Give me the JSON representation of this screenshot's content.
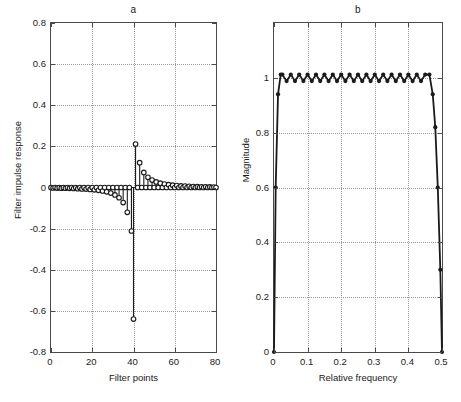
{
  "figure": {
    "width": 461,
    "height": 402,
    "background": "#ffffff",
    "line_color": "#1a1a1a",
    "grid_color": "#9a9a9a"
  },
  "panels": {
    "a": {
      "title": "a",
      "xlabel": "Filter points",
      "ylabel": "Filter impulse response",
      "xticks": [
        "0",
        "20",
        "40",
        "60",
        "80"
      ],
      "yticks": [
        "-0.8",
        "-0.6",
        "-0.4",
        "-0.2",
        "0",
        "0.2",
        "0.4",
        "0.6",
        "0.8"
      ]
    },
    "b": {
      "title": "b",
      "xlabel": "Relative frequency",
      "ylabel": "Magnitude",
      "xticks": [
        "0",
        "0.1",
        "0.2",
        "0.3",
        "0.4",
        "0.5"
      ],
      "yticks": [
        "0",
        "0.2",
        "0.4",
        "0.6",
        "0.8",
        "1"
      ]
    }
  },
  "chart_data": [
    {
      "type": "line",
      "panel": "a",
      "title": "a",
      "xlabel": "Filter points",
      "ylabel": "Filter impulse response",
      "xlim": [
        0,
        80
      ],
      "ylim": [
        -0.8,
        0.8
      ],
      "xticks": [
        0,
        20,
        40,
        60,
        80
      ],
      "yticks": [
        -0.8,
        -0.6,
        -0.4,
        -0.2,
        0,
        0.2,
        0.4,
        0.6,
        0.8
      ],
      "grid": true,
      "legend": null,
      "marker": "open-circle",
      "style": "stem",
      "description": "Antisymmetric (odd) FIR filter impulse response, 81 taps, Hilbert-transformer type. Odd-index taps are zero; odd-symmetric decaying tails about n=40.",
      "x": [
        0,
        1,
        2,
        3,
        4,
        5,
        6,
        7,
        8,
        9,
        10,
        11,
        12,
        13,
        14,
        15,
        16,
        17,
        18,
        19,
        20,
        21,
        22,
        23,
        24,
        25,
        26,
        27,
        28,
        29,
        30,
        31,
        32,
        33,
        34,
        35,
        36,
        37,
        38,
        39,
        40,
        41,
        42,
        43,
        44,
        45,
        46,
        47,
        48,
        49,
        50,
        51,
        52,
        53,
        54,
        55,
        56,
        57,
        58,
        59,
        60,
        61,
        62,
        63,
        64,
        65,
        66,
        67,
        68,
        69,
        70,
        71,
        72,
        73,
        74,
        75,
        76,
        77,
        78,
        79,
        80
      ],
      "values": [
        0,
        -0.0025,
        0,
        -0.0028,
        0,
        -0.0032,
        0,
        -0.0037,
        0,
        -0.0042,
        0,
        -0.0049,
        0,
        -0.0057,
        0,
        -0.0067,
        0,
        -0.0079,
        0,
        -0.0094,
        0,
        -0.0113,
        0,
        -0.0137,
        0,
        -0.0169,
        0,
        -0.0212,
        0,
        -0.0272,
        0,
        -0.036,
        0,
        -0.0498,
        0,
        -0.0732,
        0,
        -0.1208,
        0,
        -0.2116,
        -0.64,
        0.2116,
        0,
        0.1208,
        0,
        0.0732,
        0,
        0.0498,
        0,
        0.036,
        0,
        0.0272,
        0,
        0.0212,
        0,
        0.0169,
        0,
        0.0137,
        0,
        0.0113,
        0,
        0.0094,
        0,
        0.0079,
        0,
        0.0067,
        0,
        0.0057,
        0,
        0.0049,
        0,
        0.0042,
        0,
        0.0037,
        0,
        0.0032,
        0,
        0.0028,
        0,
        0.0025,
        0
      ]
    },
    {
      "type": "line",
      "panel": "b",
      "title": "b",
      "xlabel": "Relative frequency",
      "ylabel": "Magnitude",
      "xlim": [
        0,
        0.5
      ],
      "ylim": [
        0,
        1.2
      ],
      "xticks": [
        0,
        0.1,
        0.2,
        0.3,
        0.4,
        0.5
      ],
      "yticks": [
        0,
        0.2,
        0.4,
        0.6,
        0.8,
        1
      ],
      "grid": true,
      "legend": null,
      "marker": "filled-circle",
      "style": "line-markers",
      "description": "Equiripple magnitude response of the Hilbert transformer: rises steeply from 0 at f=0 to a flat passband near 1 with about 20 ripple cycles, then falls steeply to 0 at f=0.5.",
      "x": [
        0,
        0.005,
        0.012,
        0.02,
        0.025,
        0.0375,
        0.05,
        0.0625,
        0.075,
        0.0875,
        0.1,
        0.1125,
        0.125,
        0.1375,
        0.15,
        0.1625,
        0.175,
        0.1875,
        0.2,
        0.2125,
        0.225,
        0.2375,
        0.25,
        0.2625,
        0.275,
        0.2875,
        0.3,
        0.3125,
        0.325,
        0.3375,
        0.35,
        0.3625,
        0.375,
        0.3875,
        0.4,
        0.4125,
        0.425,
        0.4375,
        0.45,
        0.4625,
        0.4725,
        0.48,
        0.4875,
        0.495,
        0.5
      ],
      "values": [
        0,
        0.6,
        0.94,
        1.012,
        1.012,
        0.988,
        1.012,
        0.988,
        1.012,
        0.988,
        1.012,
        0.988,
        1.012,
        0.988,
        1.012,
        0.988,
        1.012,
        0.988,
        1.012,
        0.988,
        1.012,
        0.988,
        1.012,
        0.988,
        1.012,
        0.988,
        1.012,
        0.988,
        1.012,
        0.988,
        1.012,
        0.988,
        1.012,
        0.988,
        1.012,
        0.988,
        1.012,
        0.988,
        1.012,
        1.012,
        0.94,
        0.82,
        0.6,
        0.3,
        0
      ]
    }
  ]
}
